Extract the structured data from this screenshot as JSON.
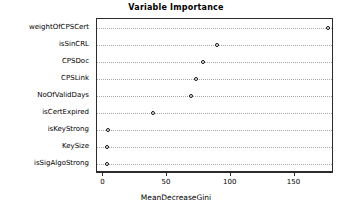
{
  "chart_data": {
    "type": "scatter",
    "title": "Variable Importance",
    "xlabel": "MeanDecreaseGini",
    "ylabel": "",
    "categories": [
      "weightOfCPSCert",
      "isSinCRL",
      "CPSDoc",
      "CPSLink",
      "NoOfValidDays",
      "isCertExpired",
      "isKeyStrong",
      "KeySize",
      "isSigAlgoStrong"
    ],
    "values": [
      176,
      89,
      78,
      73,
      69,
      39,
      4,
      3,
      3
    ],
    "xticks": [
      0,
      50,
      100,
      150
    ],
    "xlim": [
      -5,
      181
    ],
    "grid": "dotted-rows",
    "legend": "none",
    "marker": "open-circle",
    "points": [
      {
        "label": "weightOfCPSCert",
        "value": 176
      },
      {
        "label": "isSinCRL",
        "value": 89
      },
      {
        "label": "CPSDoc",
        "value": 78
      },
      {
        "label": "CPSLink",
        "value": 73
      },
      {
        "label": "NoOfValidDays",
        "value": 69
      },
      {
        "label": "isCertExpired",
        "value": 39
      },
      {
        "label": "isKeyStrong",
        "value": 4
      },
      {
        "label": "KeySize",
        "value": 3
      },
      {
        "label": "isSigAlgoStrong",
        "value": 3
      }
    ]
  },
  "colors": {
    "axis": "#2b2b2b",
    "grid": "#a8a8a8",
    "marker_stroke": "#111111",
    "background": "#ffffff",
    "text": "#000000"
  }
}
